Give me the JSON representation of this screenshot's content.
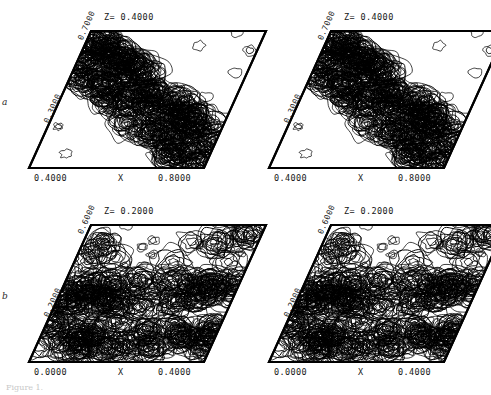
{
  "figure": {
    "type": "contour-map-grid",
    "rows": 2,
    "cols": 2,
    "caption": "Figure 1."
  },
  "chart_data": {
    "type": "contour",
    "title": "",
    "xlabel": "X",
    "ylabel": "",
    "grid": false,
    "legend": false,
    "shear_deg": 22,
    "panels": [
      {
        "id": "a-left",
        "row_label": "a",
        "title": "Z= 0.4000",
        "z_value": 0.4,
        "xlabel": "X",
        "xticks": [
          "0.4000",
          "0.8000"
        ],
        "xlim": [
          0.4,
          0.8
        ],
        "yticks": [
          "0.7000",
          "0.3000"
        ],
        "ylim": [
          0.3,
          0.7
        ],
        "seed": 11,
        "density": "diagonal-band"
      },
      {
        "id": "a-right",
        "row_label": "",
        "title": "Z= 0.4000",
        "z_value": 0.4,
        "xlabel": "X",
        "xticks": [
          "0.4000",
          "0.8000"
        ],
        "xlim": [
          0.4,
          0.8
        ],
        "yticks": [
          "0.7000",
          "0.3000"
        ],
        "ylim": [
          0.3,
          0.7
        ],
        "seed": 11,
        "density": "diagonal-band"
      },
      {
        "id": "b-left",
        "row_label": "b",
        "title": "Z= 0.2000",
        "z_value": 0.2,
        "xlabel": "X",
        "xticks": [
          "0.0000",
          "0.4000"
        ],
        "xlim": [
          0.0,
          0.4
        ],
        "yticks": [
          "0.6000",
          "0.2000"
        ],
        "ylim": [
          0.2,
          0.6
        ],
        "seed": 29,
        "density": "horizontal-band"
      },
      {
        "id": "b-right",
        "row_label": "",
        "title": "Z= 0.2000",
        "z_value": 0.2,
        "xlabel": "X",
        "xticks": [
          "0.0000",
          "0.4000"
        ],
        "xlim": [
          0.0,
          0.4
        ],
        "yticks": [
          "0.6000",
          "0.2000"
        ],
        "ylim": [
          0.2,
          0.6
        ],
        "seed": 29,
        "density": "horizontal-band"
      }
    ],
    "contour_levels": [
      0.18,
      0.3,
      0.42,
      0.54,
      0.66,
      0.78
    ],
    "colors": {
      "frame": "#000000",
      "contour": "#000000",
      "background": "#ffffff",
      "text": "#161616"
    }
  }
}
